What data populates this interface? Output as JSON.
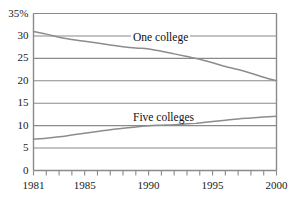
{
  "chart_data": {
    "type": "line",
    "title": "",
    "xlabel": "",
    "ylabel": "",
    "ylim": [
      0,
      35
    ],
    "xlim": [
      1981,
      2000
    ],
    "grid": true,
    "legend_position": "inline-labels",
    "y_ticks": [
      "0",
      "5",
      "10",
      "15",
      "20",
      "25",
      "30",
      "35%"
    ],
    "y_tick_values": [
      0,
      5,
      10,
      15,
      20,
      25,
      30,
      35
    ],
    "x_ticks": [
      "1981",
      "1985",
      "1990",
      "1995",
      "2000"
    ],
    "x_tick_values": [
      1981,
      1985,
      1990,
      1995,
      2000
    ],
    "x_minor_ticks": [
      1981,
      1982,
      1983,
      1984,
      1985,
      1986,
      1987,
      1988,
      1989,
      1990,
      1991,
      1992,
      1993,
      1994,
      1995,
      1996,
      1997,
      1998,
      1999,
      2000
    ],
    "x": [
      1981,
      1982,
      1983,
      1984,
      1985,
      1986,
      1987,
      1988,
      1989,
      1990,
      1991,
      1992,
      1993,
      1994,
      1995,
      1996,
      1997,
      1998,
      1999,
      2000
    ],
    "series": [
      {
        "name": "One college",
        "label_text": "One college",
        "color": "#8c8c8c",
        "values": [
          31.0,
          30.4,
          29.7,
          29.2,
          28.8,
          28.4,
          28.0,
          27.6,
          27.3,
          27.1,
          26.6,
          26.0,
          25.4,
          24.8,
          24.0,
          23.2,
          22.5,
          21.7,
          20.8,
          20.0
        ]
      },
      {
        "name": "Five colleges",
        "label_text": "Five colleges",
        "color": "#8c8c8c",
        "values": [
          7.0,
          7.2,
          7.5,
          7.9,
          8.3,
          8.7,
          9.1,
          9.4,
          9.7,
          10.0,
          10.1,
          10.2,
          10.4,
          10.6,
          10.9,
          11.2,
          11.5,
          11.7,
          11.9,
          12.1
        ]
      }
    ]
  },
  "colors": {
    "frame": "#8a8a8a",
    "gridline": "#8a8a8a",
    "series_line": "#8c8c8c",
    "text": "#1a1a1a",
    "background": "#ffffff"
  }
}
